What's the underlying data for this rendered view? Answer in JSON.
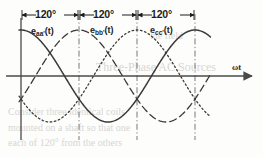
{
  "figure": {
    "name": "three-phase-voltage-waveforms",
    "axis_label": "ωt",
    "background_text": [
      {
        "text": "Three-Phase AC Sources",
        "x": 96,
        "y": 60,
        "size": 12
      },
      {
        "text": "Consider three identical coils",
        "x": 8,
        "y": 106,
        "size": 10
      },
      {
        "text": "mounted on a shaft so that one",
        "x": 8,
        "y": 122,
        "size": 10
      },
      {
        "text": "each of 120° from the others",
        "x": 8,
        "y": 137,
        "size": 10
      },
      {
        "text": "the field",
        "x": 150,
        "y": 30,
        "size": 10
      }
    ],
    "dimensions": [
      {
        "label": "120°",
        "from_deg": 0,
        "to_deg": 120
      },
      {
        "label": "120°",
        "from_deg": 120,
        "to_deg": 240
      },
      {
        "label": "120°",
        "from_deg": 240,
        "to_deg": 360
      }
    ],
    "dividers_deg": [
      120,
      240,
      360
    ],
    "curve_labels": [
      {
        "base": "e",
        "sub": "aa'",
        "suffix": "(t)",
        "x": 31,
        "y": 26
      },
      {
        "base": "e",
        "sub": "bb'",
        "suffix": "(t)",
        "x": 90,
        "y": 25
      },
      {
        "base": "e",
        "sub": "cc'",
        "suffix": "(t)",
        "x": 150,
        "y": 25
      }
    ],
    "colors": {
      "line": "#3a3a3a",
      "axis": "#4a4a4a",
      "divider": "#6a6a6a",
      "text": "#1c1c1c",
      "ghost": "#d8d6d2",
      "background": "#fdfdfc"
    }
  },
  "chart_data": {
    "type": "line",
    "title": "",
    "xlabel": "ωt",
    "ylabel": "",
    "grid": false,
    "legend": "inline-labels",
    "x_unit": "degrees",
    "xlim": [
      -10,
      400
    ],
    "ylim": [
      -1.15,
      1.15
    ],
    "x_ticks_deg": [
      0,
      120,
      240,
      360
    ],
    "phase_separation_deg": 120,
    "amplitude": 1.0,
    "series": [
      {
        "name": "e_aa'(t)",
        "label": "e",
        "subscript": "aa'",
        "style": "solid",
        "phase_deg": 0,
        "equation": "Em*cos(wt)",
        "x": [
          0,
          15,
          30,
          45,
          60,
          75,
          90,
          105,
          120,
          135,
          150,
          165,
          180,
          195,
          210,
          225,
          240,
          255,
          270,
          285,
          300,
          315,
          330,
          345,
          360,
          375,
          390
        ],
        "y": [
          1.0,
          0.966,
          0.866,
          0.707,
          0.5,
          0.259,
          0.0,
          -0.259,
          -0.5,
          -0.707,
          -0.866,
          -0.966,
          -1.0,
          -0.966,
          -0.866,
          -0.707,
          -0.5,
          -0.259,
          0.0,
          0.259,
          0.5,
          0.707,
          0.866,
          0.966,
          1.0,
          0.966,
          0.866
        ]
      },
      {
        "name": "e_bb'(t)",
        "label": "e",
        "subscript": "bb'",
        "style": "dashed",
        "phase_deg": -120,
        "equation": "Em*cos(wt-120)",
        "x": [
          0,
          15,
          30,
          45,
          60,
          75,
          90,
          105,
          120,
          135,
          150,
          165,
          180,
          195,
          210,
          225,
          240,
          255,
          270,
          285,
          300,
          315,
          330,
          345,
          360,
          375,
          390
        ],
        "y": [
          -0.5,
          -0.259,
          0.0,
          0.259,
          0.5,
          0.707,
          0.866,
          0.966,
          1.0,
          0.966,
          0.866,
          0.707,
          0.5,
          0.259,
          0.0,
          -0.259,
          -0.5,
          -0.707,
          -0.866,
          -0.966,
          -1.0,
          -0.966,
          -0.866,
          -0.707,
          -0.5,
          -0.259,
          0.0
        ]
      },
      {
        "name": "e_cc'(t)",
        "label": "e",
        "subscript": "cc'",
        "style": "dotted",
        "phase_deg": -240,
        "equation": "Em*cos(wt-240)",
        "x": [
          0,
          15,
          30,
          45,
          60,
          75,
          90,
          105,
          120,
          135,
          150,
          165,
          180,
          195,
          210,
          225,
          240,
          255,
          270,
          285,
          300,
          315,
          330,
          345,
          360,
          375,
          390
        ],
        "y": [
          -0.5,
          -0.707,
          -0.866,
          -0.966,
          -1.0,
          -0.966,
          -0.866,
          -0.707,
          -0.5,
          -0.259,
          0.0,
          0.259,
          0.5,
          0.707,
          0.866,
          0.966,
          1.0,
          0.966,
          0.866,
          0.707,
          0.5,
          0.259,
          0.0,
          -0.259,
          -0.5,
          -0.707,
          -0.866
        ]
      }
    ],
    "annotations": [
      {
        "text": "120°",
        "from_deg": 0,
        "to_deg": 120
      },
      {
        "text": "120°",
        "from_deg": 120,
        "to_deg": 240
      },
      {
        "text": "120°",
        "from_deg": 240,
        "to_deg": 360
      }
    ]
  }
}
